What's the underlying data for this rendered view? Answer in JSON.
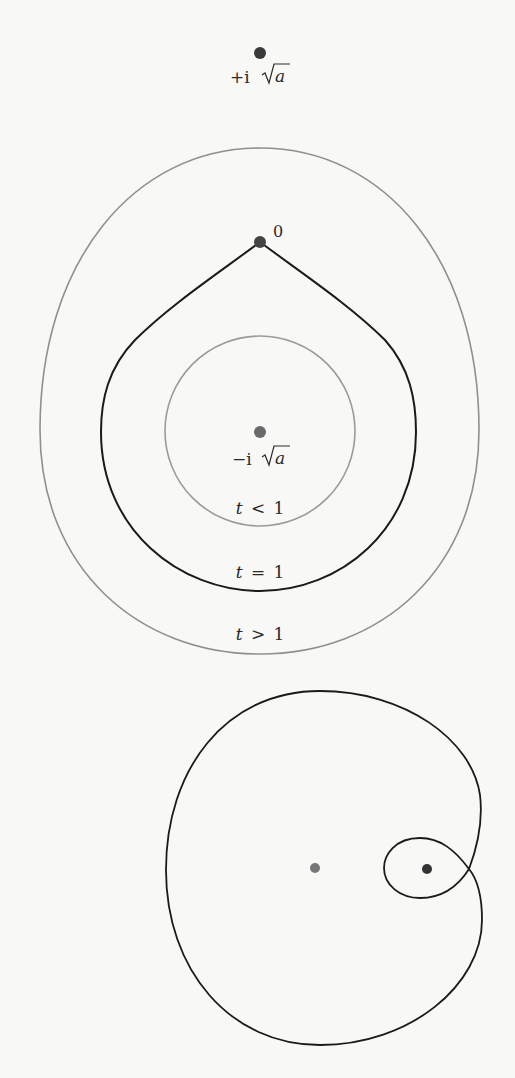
{
  "figure_top": {
    "points": [
      {
        "id": "plus_i_sqrt_a",
        "label_prefix": "+i",
        "label_radicand": "a",
        "x": 260,
        "y": 53,
        "color": "#3a3a3a"
      },
      {
        "id": "origin",
        "label": "0",
        "x": 260,
        "y": 242,
        "color": "#444444"
      },
      {
        "id": "minus_i_sqrt_a",
        "label_prefix": "−i",
        "label_radicand": "a",
        "x": 260,
        "y": 432,
        "color": "#6a6a6a"
      }
    ],
    "curves": [
      {
        "id": "t_less_1",
        "label_t": "t",
        "label_rel": "<",
        "label_val": "1",
        "color": "#9a9a9a",
        "style": "circle"
      },
      {
        "id": "t_equal_1",
        "label_t": "t",
        "label_rel": "=",
        "label_val": "1",
        "color": "#1a1a1a",
        "style": "teardrop-cusp"
      },
      {
        "id": "t_greater_1",
        "label_t": "t",
        "label_rel": ">",
        "label_val": "1",
        "color": "#8a8a8a",
        "style": "oval"
      }
    ]
  },
  "figure_bottom": {
    "points": [
      {
        "id": "left_point",
        "x": 315,
        "y": 868,
        "color": "#777777"
      },
      {
        "id": "right_point",
        "x": 427,
        "y": 869,
        "color": "#333333"
      }
    ],
    "curve": {
      "id": "looped_curve",
      "color": "#1a1a1a",
      "style": "self-intersecting loop"
    }
  },
  "colors": {
    "background": "#f8f8f6",
    "black_curve": "#1a1a1a",
    "gray_curve": "#8f8f8f",
    "label": "#2a2a2a"
  }
}
